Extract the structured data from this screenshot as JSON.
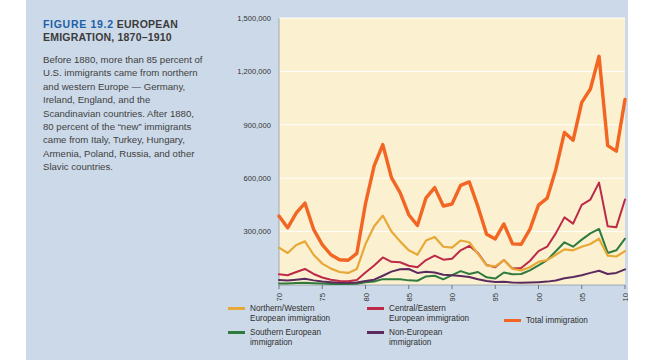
{
  "figure": {
    "title_number": "FIGURE 19.2",
    "title_text": "EUROPEAN EMIGRATION, 1870–1910",
    "caption": "Before 1880, more than 85 percent of U.S. immigrants came from northern and western Europe — Germany, Ireland, England, and the Scandinavian countries. After 1880, 80 percent of the “new” immigrants came from Italy, Turkey, Hungary, Armenia, Poland, Russia, and other Slavic countries.",
    "title_number_color": "#1c5fa8",
    "panel_color": "#ccd9e8",
    "plot_bg_color": "#fbf0d0"
  },
  "legend": {
    "items": [
      {
        "label": "Northern/Western European immigration",
        "color": "#e8a838",
        "key": "northern_western"
      },
      {
        "label": "Southern European immigration",
        "color": "#2f7a3e",
        "key": "southern"
      },
      {
        "label": "Central/Eastern European immigration",
        "color": "#bd2a47",
        "key": "central_eastern"
      },
      {
        "label": "Non-European immigration",
        "color": "#5b2a5e",
        "key": "non_european"
      },
      {
        "label": "Total immigration",
        "color": "#f26522",
        "key": "total"
      }
    ]
  },
  "chart_data": {
    "type": "line",
    "title": "EUROPEAN EMIGRATION, 1870–1910",
    "xlabel": "",
    "ylabel": "",
    "grid": true,
    "legend_position": "bottom",
    "xlim": [
      1870,
      1910
    ],
    "ylim": [
      0,
      1500000
    ],
    "yticks": [
      300000,
      600000,
      900000,
      1200000,
      1500000
    ],
    "ytick_labels": [
      "300,000",
      "600,000",
      "900,000",
      "1,200,000",
      "1,500,000"
    ],
    "xticks": [
      1870,
      1875,
      1880,
      1885,
      1890,
      1895,
      1900,
      1905,
      1910
    ],
    "xtick_labels": [
      "1870",
      "1875",
      "1880",
      "1885",
      "1890",
      "1895",
      "1900",
      "1905",
      "1910"
    ],
    "x": [
      1870,
      1871,
      1872,
      1873,
      1874,
      1875,
      1876,
      1877,
      1878,
      1879,
      1880,
      1881,
      1882,
      1883,
      1884,
      1885,
      1886,
      1887,
      1888,
      1889,
      1890,
      1891,
      1892,
      1893,
      1894,
      1895,
      1896,
      1897,
      1898,
      1899,
      1900,
      1901,
      1902,
      1903,
      1904,
      1905,
      1906,
      1907,
      1908,
      1909,
      1910
    ],
    "series": [
      {
        "name": "Total immigration",
        "color": "#f26522",
        "values": [
          387000,
          321000,
          405000,
          460000,
          313000,
          227000,
          170000,
          142000,
          139000,
          178000,
          457000,
          669000,
          789000,
          603000,
          519000,
          395000,
          334000,
          490000,
          547000,
          444000,
          455000,
          560000,
          579000,
          440000,
          285000,
          259000,
          343000,
          231000,
          229000,
          312000,
          449000,
          488000,
          649000,
          857000,
          813000,
          1026000,
          1101000,
          1285000,
          783000,
          752000,
          1042000
        ]
      },
      {
        "name": "Northern/Western European immigration",
        "color": "#e8a838",
        "values": [
          210000,
          180000,
          225000,
          245000,
          170000,
          120000,
          92000,
          73000,
          68000,
          90000,
          230000,
          330000,
          390000,
          300000,
          245000,
          195000,
          170000,
          250000,
          270000,
          215000,
          210000,
          250000,
          240000,
          175000,
          110000,
          105000,
          140000,
          90000,
          82000,
          100000,
          130000,
          140000,
          170000,
          200000,
          195000,
          215000,
          230000,
          260000,
          165000,
          160000,
          190000
        ]
      },
      {
        "name": "Central/Eastern European immigration",
        "color": "#bd2a47",
        "values": [
          60000,
          55000,
          73000,
          90000,
          62000,
          42000,
          30000,
          22000,
          21000,
          28000,
          70000,
          110000,
          155000,
          130000,
          128000,
          108000,
          100000,
          140000,
          165000,
          142000,
          148000,
          195000,
          220000,
          180000,
          112000,
          100000,
          140000,
          92000,
          95000,
          135000,
          190000,
          215000,
          290000,
          380000,
          345000,
          450000,
          480000,
          575000,
          330000,
          325000,
          480000
        ]
      },
      {
        "name": "Southern European immigration",
        "color": "#2f7a3e",
        "values": [
          9000,
          9000,
          11000,
          13000,
          10000,
          8000,
          6000,
          5000,
          5000,
          7000,
          15000,
          20000,
          33000,
          32000,
          32000,
          26000,
          24000,
          48000,
          52000,
          32000,
          55000,
          78000,
          62000,
          73000,
          43000,
          36000,
          70000,
          60000,
          62000,
          82000,
          110000,
          140000,
          190000,
          240000,
          215000,
          255000,
          290000,
          315000,
          180000,
          195000,
          260000
        ]
      },
      {
        "name": "Non-European immigration",
        "color": "#5b2a5e",
        "values": [
          28000,
          25000,
          30000,
          35000,
          26000,
          20000,
          16000,
          13000,
          12000,
          14000,
          22000,
          30000,
          52000,
          75000,
          88000,
          90000,
          68000,
          75000,
          70000,
          58000,
          55000,
          50000,
          45000,
          32000,
          22000,
          17000,
          18000,
          14000,
          13000,
          14000,
          16000,
          19000,
          25000,
          38000,
          45000,
          55000,
          68000,
          80000,
          62000,
          68000,
          88000
        ]
      }
    ]
  }
}
